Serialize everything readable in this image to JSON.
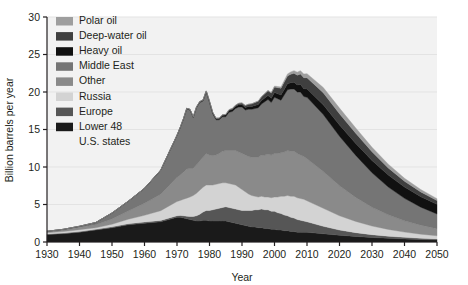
{
  "chart_data": {
    "type": "area",
    "stacked": true,
    "title": "",
    "xlabel": "Year",
    "ylabel": "Billion barrels per year",
    "xlim": [
      1930,
      2050
    ],
    "ylim": [
      0,
      30
    ],
    "xticks": [
      1930,
      1940,
      1950,
      1960,
      1970,
      1980,
      1990,
      2000,
      2010,
      2020,
      2030,
      2040,
      2050
    ],
    "yticks": [
      0,
      5,
      10,
      15,
      20,
      25,
      30
    ],
    "grid": "horizontal",
    "legend_position": "top-left",
    "x": [
      1930,
      1935,
      1940,
      1945,
      1950,
      1955,
      1960,
      1965,
      1970,
      1971,
      1972,
      1973,
      1974,
      1975,
      1976,
      1977,
      1978,
      1979,
      1980,
      1981,
      1982,
      1983,
      1984,
      1985,
      1986,
      1987,
      1988,
      1989,
      1990,
      1991,
      1992,
      1993,
      1994,
      1995,
      1996,
      1997,
      1998,
      1999,
      2000,
      2001,
      2002,
      2003,
      2004,
      2005,
      2006,
      2007,
      2008,
      2009,
      2010,
      2015,
      2020,
      2025,
      2030,
      2035,
      2040,
      2045,
      2050
    ],
    "series": [
      {
        "name": "Lower 48 U.S. states",
        "color": "#1a1a1a",
        "values": [
          1.0,
          1.1,
          1.3,
          1.6,
          1.9,
          2.3,
          2.5,
          2.7,
          3.3,
          3.3,
          3.2,
          3.1,
          3.0,
          2.9,
          2.8,
          2.8,
          2.9,
          2.9,
          2.8,
          2.8,
          2.8,
          2.8,
          2.8,
          2.8,
          2.7,
          2.6,
          2.5,
          2.4,
          2.3,
          2.2,
          2.1,
          2.0,
          2.0,
          1.9,
          1.9,
          1.8,
          1.8,
          1.7,
          1.7,
          1.6,
          1.6,
          1.5,
          1.5,
          1.4,
          1.4,
          1.3,
          1.3,
          1.3,
          1.3,
          1.1,
          0.9,
          0.75,
          0.6,
          0.5,
          0.4,
          0.33,
          0.28
        ]
      },
      {
        "name": "Europe",
        "color": "#565656",
        "values": [
          0.08,
          0.09,
          0.1,
          0.1,
          0.12,
          0.14,
          0.16,
          0.18,
          0.2,
          0.25,
          0.3,
          0.35,
          0.4,
          0.5,
          0.7,
          0.9,
          1.1,
          1.3,
          1.4,
          1.5,
          1.6,
          1.7,
          1.8,
          1.9,
          1.9,
          1.9,
          1.9,
          1.9,
          1.9,
          2.0,
          2.1,
          2.2,
          2.3,
          2.4,
          2.5,
          2.5,
          2.5,
          2.4,
          2.4,
          2.3,
          2.2,
          2.1,
          2.0,
          1.9,
          1.8,
          1.7,
          1.6,
          1.5,
          1.4,
          1.0,
          0.7,
          0.5,
          0.38,
          0.28,
          0.22,
          0.17,
          0.13
        ]
      },
      {
        "name": "Russia",
        "color": "#d3d3d3",
        "values": [
          0.15,
          0.2,
          0.25,
          0.2,
          0.35,
          0.6,
          0.9,
          1.3,
          1.9,
          2.0,
          2.2,
          2.4,
          2.6,
          2.8,
          3.0,
          3.2,
          3.3,
          3.4,
          3.4,
          3.3,
          3.3,
          3.3,
          3.3,
          3.2,
          3.2,
          3.2,
          3.2,
          3.0,
          2.8,
          2.5,
          2.2,
          2.0,
          1.8,
          1.7,
          1.7,
          1.7,
          1.7,
          1.8,
          1.9,
          2.1,
          2.3,
          2.5,
          2.7,
          2.8,
          2.9,
          2.9,
          2.9,
          2.9,
          2.8,
          2.4,
          1.9,
          1.5,
          1.15,
          0.9,
          0.7,
          0.55,
          0.42
        ]
      },
      {
        "name": "Other",
        "color": "#8a8a8a",
        "values": [
          0.15,
          0.2,
          0.3,
          0.4,
          0.7,
          1.1,
          1.6,
          2.2,
          3.2,
          3.4,
          3.6,
          3.9,
          3.8,
          3.6,
          3.8,
          3.9,
          4.0,
          4.2,
          4.0,
          3.9,
          3.9,
          4.0,
          4.2,
          4.3,
          4.4,
          4.5,
          4.6,
          4.7,
          4.8,
          4.9,
          5.0,
          5.1,
          5.2,
          5.3,
          5.5,
          5.6,
          5.7,
          5.7,
          5.8,
          5.8,
          5.8,
          5.9,
          6.0,
          6.0,
          6.0,
          5.9,
          5.8,
          5.7,
          5.6,
          4.9,
          4.0,
          3.2,
          2.5,
          1.95,
          1.5,
          1.2,
          0.95
        ]
      },
      {
        "name": "Middle East",
        "color": "#757575",
        "values": [
          0.05,
          0.1,
          0.15,
          0.3,
          0.8,
          1.3,
          2.0,
          3.2,
          5.6,
          6.3,
          7.1,
          8.0,
          7.8,
          6.8,
          7.6,
          7.8,
          7.5,
          8.2,
          7.0,
          5.6,
          4.7,
          4.5,
          4.6,
          4.5,
          5.1,
          5.2,
          5.6,
          6.0,
          6.2,
          6.0,
          6.3,
          6.4,
          6.5,
          6.6,
          6.8,
          7.1,
          7.3,
          7.0,
          7.5,
          7.3,
          7.0,
          7.6,
          8.1,
          8.3,
          8.3,
          8.2,
          8.4,
          8.0,
          8.2,
          7.6,
          6.6,
          5.6,
          4.6,
          3.7,
          3.0,
          2.4,
          1.95
        ]
      },
      {
        "name": "Heavy oil",
        "color": "#111111",
        "values": [
          0.0,
          0.0,
          0.0,
          0.0,
          0.0,
          0.0,
          0.0,
          0.02,
          0.05,
          0.06,
          0.07,
          0.08,
          0.09,
          0.1,
          0.11,
          0.12,
          0.13,
          0.14,
          0.15,
          0.16,
          0.17,
          0.18,
          0.2,
          0.22,
          0.24,
          0.26,
          0.28,
          0.3,
          0.32,
          0.34,
          0.36,
          0.38,
          0.4,
          0.43,
          0.46,
          0.5,
          0.54,
          0.58,
          0.62,
          0.66,
          0.7,
          0.75,
          0.8,
          0.85,
          0.9,
          0.95,
          1.0,
          1.05,
          1.1,
          1.3,
          1.5,
          1.6,
          1.65,
          1.6,
          1.5,
          1.4,
          1.3
        ]
      },
      {
        "name": "Deep-water oil",
        "color": "#3f3f3f",
        "values": [
          0.0,
          0.0,
          0.0,
          0.0,
          0.0,
          0.0,
          0.0,
          0.0,
          0.0,
          0.0,
          0.0,
          0.0,
          0.0,
          0.0,
          0.0,
          0.0,
          0.0,
          0.0,
          0.02,
          0.03,
          0.04,
          0.05,
          0.07,
          0.09,
          0.11,
          0.13,
          0.16,
          0.19,
          0.22,
          0.26,
          0.3,
          0.35,
          0.4,
          0.45,
          0.5,
          0.56,
          0.62,
          0.68,
          0.75,
          0.82,
          0.9,
          0.98,
          1.05,
          1.12,
          1.2,
          1.3,
          1.4,
          1.45,
          1.5,
          1.6,
          1.5,
          1.35,
          1.15,
          0.95,
          0.78,
          0.63,
          0.5
        ]
      },
      {
        "name": "Polar oil",
        "color": "#9e9e9e",
        "values": [
          0.0,
          0.0,
          0.0,
          0.0,
          0.0,
          0.0,
          0.0,
          0.0,
          0.0,
          0.0,
          0.0,
          0.0,
          0.0,
          0.0,
          0.0,
          0.0,
          0.0,
          0.0,
          0.0,
          0.0,
          0.0,
          0.0,
          0.0,
          0.0,
          0.0,
          0.0,
          0.0,
          0.0,
          0.0,
          0.0,
          0.0,
          0.0,
          0.02,
          0.03,
          0.04,
          0.05,
          0.07,
          0.09,
          0.12,
          0.15,
          0.18,
          0.22,
          0.26,
          0.3,
          0.35,
          0.4,
          0.45,
          0.5,
          0.55,
          0.7,
          0.75,
          0.7,
          0.6,
          0.5,
          0.4,
          0.32,
          0.25
        ]
      }
    ]
  },
  "legend": {
    "items": [
      {
        "label": "Polar oil",
        "color": "#9e9e9e"
      },
      {
        "label": "Deep-water oil",
        "color": "#3f3f3f"
      },
      {
        "label": "Heavy oil",
        "color": "#111111"
      },
      {
        "label": "Middle East",
        "color": "#757575"
      },
      {
        "label": "Other",
        "color": "#8a8a8a"
      },
      {
        "label": "Russia",
        "color": "#d3d3d3"
      },
      {
        "label": "Europe",
        "color": "#565656"
      },
      {
        "label": "Lower 48",
        "color": "#1a1a1a"
      },
      {
        "label": "U.S. states",
        "color": null
      }
    ]
  },
  "colors": {
    "plot_background": "#f2f2f2",
    "grid": "#e3e3e3",
    "axis": "#231f20",
    "text": "#231f20",
    "page_background": "#ffffff"
  }
}
